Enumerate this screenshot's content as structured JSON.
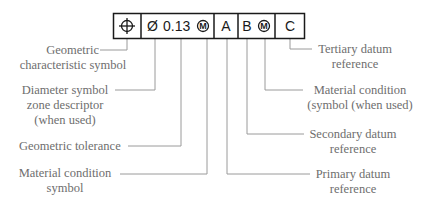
{
  "frame": {
    "compartments": [
      {
        "id": "characteristic",
        "symbol": "position-icon"
      },
      {
        "id": "tolerance",
        "diameter": "Ø",
        "value": "0.13",
        "modifier": "M"
      },
      {
        "id": "primary",
        "text": "A"
      },
      {
        "id": "secondary",
        "text": "B",
        "modifier": "M"
      },
      {
        "id": "tertiary",
        "text": "C"
      }
    ]
  },
  "labels": {
    "geometric_characteristic": {
      "line1": "Geometric",
      "line2": "characteristic symbol"
    },
    "diameter_symbol": {
      "line1": "Diameter symbol",
      "line2": "zone descriptor",
      "line3": "(when used)"
    },
    "geometric_tolerance": {
      "line1": "Geometric tolerance"
    },
    "material_condition_left": {
      "line1": "Material condition",
      "line2": "symbol"
    },
    "tertiary_datum": {
      "line1": "Tertiary datum",
      "line2": "reference"
    },
    "material_condition_right": {
      "line1": "Material condition",
      "line2": "(symbol (when used)"
    },
    "secondary_datum": {
      "line1": "Secondary datum",
      "line2": "reference"
    },
    "primary_datum": {
      "line1": "Primary datum",
      "line2": "reference"
    }
  },
  "colors": {
    "frame_line": "#1a1a1a",
    "leader_line": "#9a9a9a",
    "label_text": "#6e6e6e"
  }
}
